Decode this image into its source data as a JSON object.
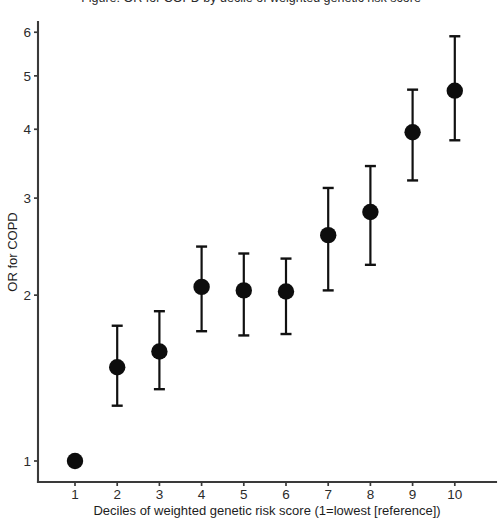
{
  "figure": {
    "cropped_title": "Figure: OR for COPD by decile of weighted genetic risk score",
    "width": 502,
    "height": 522
  },
  "chart_data": {
    "type": "scatter",
    "title": "",
    "xlabel": "Deciles of weighted genetic risk score (1=lowest [reference])",
    "ylabel": "OR for COPD",
    "yscale": "log",
    "ylim": [
      0.85,
      6.6
    ],
    "xlim": [
      0.4,
      10.6
    ],
    "grid": false,
    "legend": null,
    "yticks": [
      1,
      2,
      3,
      4,
      5,
      6
    ],
    "ytick_labels": [
      "1",
      "2",
      "3",
      "4",
      "5",
      "6"
    ],
    "xticks": [
      1,
      2,
      3,
      4,
      5,
      6,
      7,
      8,
      9,
      10
    ],
    "xtick_labels": [
      "1",
      "2",
      "3",
      "4",
      "5",
      "6",
      "7",
      "8",
      "9",
      "10"
    ],
    "categories": [
      "1",
      "2",
      "3",
      "4",
      "5",
      "6",
      "7",
      "8",
      "9",
      "10"
    ],
    "values": [
      1.0,
      1.48,
      1.58,
      2.07,
      2.04,
      2.03,
      2.57,
      2.83,
      3.95,
      4.7
    ],
    "ci_low": [
      1.0,
      1.26,
      1.35,
      1.72,
      1.69,
      1.7,
      2.04,
      2.27,
      3.23,
      3.82
    ],
    "ci_high": [
      1.0,
      1.76,
      1.87,
      2.45,
      2.38,
      2.33,
      3.13,
      3.43,
      4.72,
      5.9
    ],
    "reference_index": 0,
    "marker": "filled-circle",
    "marker_color": "#0d0d0d",
    "errorbar_color": "#111111"
  }
}
